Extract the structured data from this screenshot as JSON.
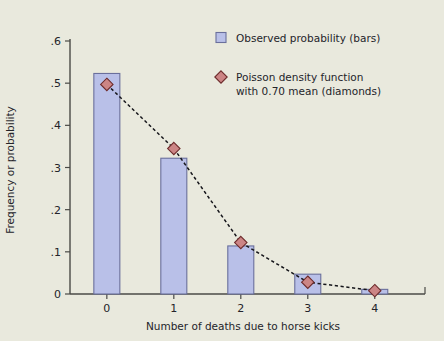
{
  "chart_data": {
    "type": "bar",
    "title": "",
    "subtitle": "",
    "xlabel": "Number of deaths due to horse kicks",
    "ylabel": "Frequency or probability",
    "categories": [
      "0",
      "1",
      "2",
      "3",
      "4"
    ],
    "x": [
      0,
      1,
      2,
      3,
      4
    ],
    "xlim": [
      -0.55,
      4.75
    ],
    "ylim": [
      0,
      0.6
    ],
    "xticks": [
      "0",
      "1",
      "2",
      "3",
      "4"
    ],
    "yticks": [
      "0",
      ".1",
      ".2",
      ".3",
      ".4",
      ".5",
      ".6"
    ],
    "ytick_values": [
      0,
      0.1,
      0.2,
      0.3,
      0.4,
      0.5,
      0.6
    ],
    "grid": false,
    "legend_position": "upper right",
    "series": [
      {
        "name": "Observed probability (bars)",
        "type": "bar",
        "values": [
          0.523,
          0.322,
          0.114,
          0.047,
          0.011
        ],
        "color": "#b9c0e8",
        "edge_color": "#6a6f9c"
      },
      {
        "name": "Poisson density function with 0.70 mean (diamonds)",
        "type": "line",
        "marker": "diamond",
        "values": [
          0.497,
          0.345,
          0.122,
          0.028,
          0.008
        ],
        "color": "#cc8585",
        "edge_color": "#6d2b2b",
        "linestyle": "dashed",
        "line_color": "#15151a"
      }
    ],
    "annotations": []
  },
  "legend": {
    "entries": [
      {
        "marker": "square",
        "lines": [
          "Observed probability (bars)"
        ]
      },
      {
        "marker": "diamond",
        "lines": [
          "Poisson density function",
          "with 0.70 mean (diamonds)"
        ]
      }
    ]
  },
  "colors": {
    "background": "#e9e9dd",
    "bar_fill": "#b9c0e8",
    "bar_edge": "#6a6f9c",
    "marker_fill": "#cc8585",
    "marker_edge": "#6d2b2b",
    "axis": "#4a4a46",
    "text": "#24242a"
  }
}
